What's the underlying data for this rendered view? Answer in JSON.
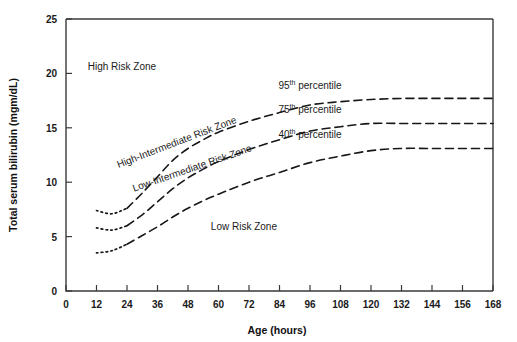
{
  "chart_data": {
    "type": "line",
    "title": "",
    "xlabel": "Age (hours)",
    "ylabel": "Total serum bilirubin (mgm/dL)",
    "xlim": [
      0,
      168
    ],
    "ylim": [
      0,
      25
    ],
    "xticks": [
      0,
      12,
      24,
      36,
      48,
      60,
      72,
      84,
      96,
      108,
      120,
      132,
      144,
      156,
      168
    ],
    "yticks": [
      0,
      5,
      10,
      15,
      20,
      25
    ],
    "grid": false,
    "legend_position": "inline-right",
    "linestyle_note": "dotted before 24 hours, dashed thereafter",
    "series": [
      {
        "name": "95th percentile",
        "label_main": "95",
        "label_sup": "th",
        "label_tail": " percentile",
        "x": [
          12,
          18,
          24,
          30,
          36,
          42,
          48,
          54,
          60,
          72,
          84,
          96,
          108,
          120,
          132,
          144,
          156,
          168
        ],
        "values": [
          7.4,
          7.1,
          7.6,
          9.0,
          10.5,
          12.0,
          13.1,
          13.9,
          14.6,
          15.6,
          16.4,
          17.1,
          17.4,
          17.6,
          17.7,
          17.7,
          17.7,
          17.7
        ]
      },
      {
        "name": "75th percentile",
        "label_main": "75",
        "label_sup": "th",
        "label_tail": " percentile",
        "x": [
          12,
          18,
          24,
          30,
          36,
          42,
          48,
          54,
          60,
          72,
          84,
          96,
          108,
          120,
          132,
          144,
          156,
          168
        ],
        "values": [
          5.8,
          5.6,
          6.0,
          7.0,
          8.2,
          9.4,
          10.4,
          11.2,
          11.9,
          13.0,
          13.9,
          14.7,
          15.1,
          15.4,
          15.4,
          15.4,
          15.4,
          15.4
        ]
      },
      {
        "name": "40th percentile",
        "label_main": "40",
        "label_sup": "th",
        "label_tail": " percentile",
        "x": [
          12,
          18,
          24,
          30,
          36,
          42,
          48,
          54,
          60,
          72,
          84,
          96,
          108,
          120,
          132,
          144,
          156,
          168
        ],
        "values": [
          3.5,
          3.7,
          4.3,
          5.1,
          5.9,
          6.8,
          7.6,
          8.3,
          8.9,
          10.0,
          10.9,
          11.8,
          12.4,
          12.9,
          13.1,
          13.1,
          13.1,
          13.1
        ]
      }
    ],
    "annotations": [
      {
        "text": "High Risk Zone",
        "x": 22,
        "y": 20.3,
        "rotation": 0
      },
      {
        "text": "High-Intermediate Risk Zone",
        "x": 44,
        "y": 13.4,
        "rotation": -21
      },
      {
        "text": "Low-Intermediate Risk Zone",
        "x": 50,
        "y": 11.0,
        "rotation": -19
      },
      {
        "text": "Low Risk Zone",
        "x": 70,
        "y": 5.6,
        "rotation": 0
      }
    ]
  },
  "axes": {
    "x_title": "Age (hours)",
    "y_title": "Total serum bilirubin (mgm/dL)",
    "x_tick_labels": [
      "0",
      "12",
      "24",
      "36",
      "48",
      "60",
      "72",
      "84",
      "96",
      "108",
      "120",
      "132",
      "144",
      "156",
      "168"
    ],
    "y_tick_labels": [
      "0",
      "5",
      "10",
      "15",
      "20",
      "25"
    ]
  },
  "zones": {
    "high": "High Risk Zone",
    "high_intermediate": "High-Intermediate Risk Zone",
    "low_intermediate": "Low-Intermediate Risk Zone",
    "low": "Low Risk Zone"
  },
  "colors": {
    "background": "#ffffff",
    "axis": "#3a3a3a",
    "curve": "#171717",
    "text": "#1a1a1a"
  }
}
